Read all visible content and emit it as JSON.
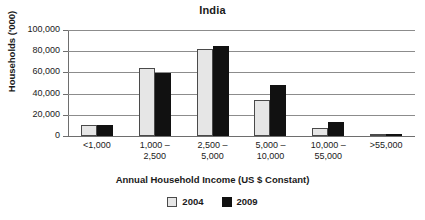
{
  "chart_data": {
    "type": "bar",
    "title": "India",
    "xlabel": "Annual Household Income (US $ Constant)",
    "ylabel": "Households ('000)",
    "categories": [
      "<1,000",
      "1,000 –\n2,500",
      "2,500 –\n5,000",
      "5,000 –\n10,000",
      "10,000 –\n55,000",
      ">55,000"
    ],
    "category_lines": [
      [
        "<1,000",
        ""
      ],
      [
        "1,000 –",
        "2,500"
      ],
      [
        "2,500 –",
        "5,000"
      ],
      [
        "5,000 –",
        "10,000"
      ],
      [
        "10,000 –",
        "55,000"
      ],
      [
        ">55,000",
        ""
      ]
    ],
    "series": [
      {
        "name": "2004",
        "color": "#e6e6e6",
        "values": [
          10500,
          64000,
          82000,
          34000,
          8000,
          600
        ]
      },
      {
        "name": "2009",
        "color": "#111111",
        "values": [
          10000,
          59000,
          85000,
          48000,
          13500,
          800
        ]
      }
    ],
    "ylim": [
      0,
      100000
    ],
    "ytick_values": [
      0,
      20000,
      40000,
      60000,
      80000,
      100000
    ],
    "ytick_labels": [
      "0",
      "20,000",
      "40,000",
      "60,000",
      "80,000",
      "100,000"
    ],
    "grid": true,
    "legend_position": "bottom",
    "legend": [
      "2004",
      "2009"
    ]
  }
}
